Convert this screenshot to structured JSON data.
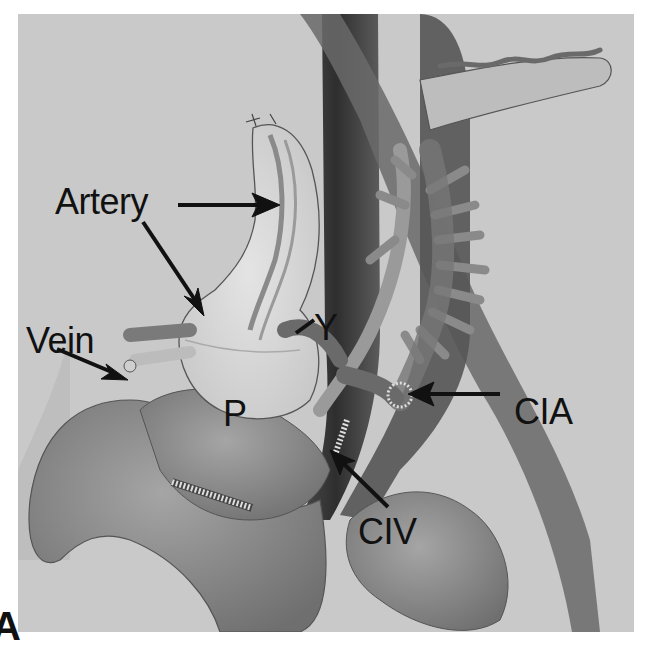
{
  "figure": {
    "panel_letter": "A",
    "labels": {
      "artery": "Artery",
      "vein": "Vein",
      "y_graft": "Y",
      "pancreas": "P",
      "cia": "CIA",
      "civ": "CIV"
    },
    "colors": {
      "background": "#c9c9c9",
      "organ_light": "#d8d8d8",
      "vessel_dark": "#5a5a5a",
      "vessel_mid": "#7a7a7a",
      "bowel": "#8e8e8e",
      "text": "#111111"
    }
  }
}
